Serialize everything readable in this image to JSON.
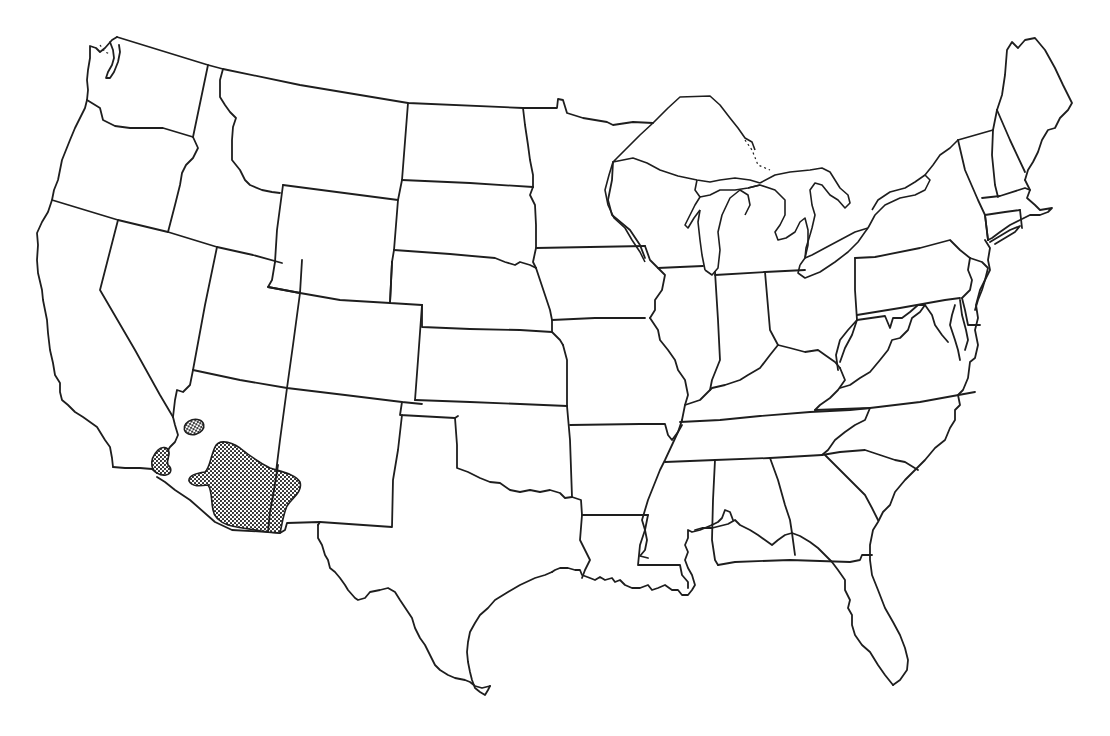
{
  "map": {
    "type": "outline map",
    "region": "Contiguous United States",
    "style": "black-and-white line drawing, state boundaries",
    "background_color": "#ffffff",
    "line_color": "#1e1e1e",
    "range_fill": "stippled dot pattern (gray/black)",
    "labels_visible": false,
    "shaded_ranges": [
      {
        "name": "range-southern-arizona",
        "location": "Southern Arizona extending into southwestern New Mexico",
        "size": "large"
      },
      {
        "name": "range-western-arizona",
        "location": "Western Arizona near Colorado River",
        "size": "small oval"
      },
      {
        "name": "range-southeast-california",
        "location": "Southeastern California near the Colorado River / Mexico border",
        "size": "small"
      }
    ]
  },
  "a11y": {
    "title": "Map of the contiguous United States with shaded distribution range in the Southwest"
  }
}
